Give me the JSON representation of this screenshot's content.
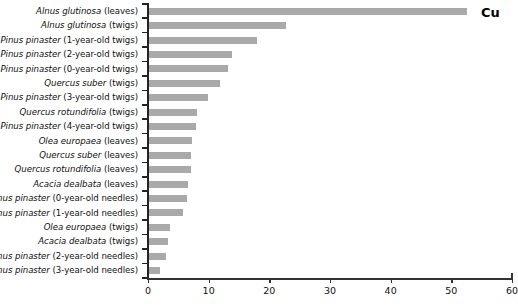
{
  "chart_data": {
    "type": "bar",
    "orientation": "horizontal",
    "title": "",
    "annotation": "Cu",
    "xlabel": "",
    "ylabel": "",
    "xlim": [
      0,
      60
    ],
    "xticks": [
      0,
      10,
      20,
      30,
      40,
      50,
      60
    ],
    "grid": false,
    "legend": null,
    "bar_color": "#a9a9a9",
    "axis_color": "#222222",
    "categories": [
      "Alnus glutinosa (leaves)",
      "Alnus glutinosa (twigs)",
      "Pinus pinaster (1-year-old twigs)",
      "Pinus pinaster (2-year-old twigs)",
      "Pinus pinaster (0-year-old twigs)",
      "Quercus suber (twigs)",
      "Pinus pinaster (3-year-old twigs)",
      "Quercus rotundifolia (twigs)",
      "Pinus pinaster (4-year-old twigs)",
      "Olea europaea (leaves)",
      "Quercus suber (leaves)",
      "Quercus rotundifolia (leaves)",
      "Acacia dealbata (leaves)",
      "Pinus pinaster (0-year-old needles)",
      "Pinus pinaster (1-year-old needles)",
      "Olea europaea (twigs)",
      "Acacia dealbata (twigs)",
      "Pinus pinaster (2-year-old needles)",
      "Pinus pinaster (3-year-old needles)"
    ],
    "values": [
      52.5,
      22.8,
      18.0,
      13.9,
      13.2,
      11.9,
      9.9,
      8.0,
      7.9,
      7.2,
      7.1,
      7.1,
      6.6,
      6.5,
      5.7,
      3.6,
      3.3,
      2.9,
      1.9
    ],
    "rows": [
      {
        "species": "Alnus glutinosa",
        "part": "(leaves)",
        "value": 52.5
      },
      {
        "species": "Alnus glutinosa",
        "part": "(twigs)",
        "value": 22.8
      },
      {
        "species": "Pinus pinaster",
        "part": "(1-year-old twigs)",
        "value": 18.0
      },
      {
        "species": "Pinus pinaster",
        "part": "(2-year-old twigs)",
        "value": 13.9
      },
      {
        "species": "Pinus pinaster",
        "part": "(0-year-old twigs)",
        "value": 13.2
      },
      {
        "species": "Quercus suber",
        "part": "(twigs)",
        "value": 11.9
      },
      {
        "species": "Pinus pinaster",
        "part": "(3-year-old twigs)",
        "value": 9.9
      },
      {
        "species": "Quercus rotundifolia",
        "part": "(twigs)",
        "value": 8.0
      },
      {
        "species": "Pinus pinaster",
        "part": "(4-year-old twigs)",
        "value": 7.9
      },
      {
        "species": "Olea europaea",
        "part": "(leaves)",
        "value": 7.2
      },
      {
        "species": "Quercus suber",
        "part": "(leaves)",
        "value": 7.1
      },
      {
        "species": "Quercus rotundifolia",
        "part": "(leaves)",
        "value": 7.1
      },
      {
        "species": "Acacia dealbata",
        "part": "(leaves)",
        "value": 6.6
      },
      {
        "species": "Pinus pinaster",
        "part": "(0-year-old needles)",
        "value": 6.5
      },
      {
        "species": "Pinus pinaster",
        "part": "(1-year-old needles)",
        "value": 5.7
      },
      {
        "species": "Olea europaea",
        "part": "(twigs)",
        "value": 3.6
      },
      {
        "species": "Acacia dealbata",
        "part": "(twigs)",
        "value": 3.3
      },
      {
        "species": "Pinus pinaster",
        "part": "(2-year-old needles)",
        "value": 2.9
      },
      {
        "species": "Pinus pinaster",
        "part": "(3-year-old needles)",
        "value": 1.9
      }
    ]
  }
}
